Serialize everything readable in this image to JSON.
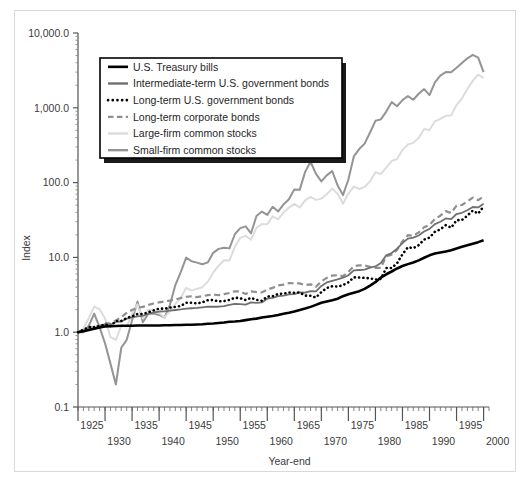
{
  "chart_data": {
    "type": "line",
    "title": "",
    "xlabel": "Year-end",
    "ylabel": "Index",
    "yscale": "log",
    "ylim": [
      0.1,
      10000
    ],
    "xlim": [
      1925,
      2001
    ],
    "grid": false,
    "legend_position": "upper-left-inside",
    "ytick_labels": [
      "10,000.0",
      "1,000.0",
      "100.0",
      "10.0",
      "1.0",
      "0.1"
    ],
    "ytick_values": [
      10000,
      1000,
      100,
      10,
      1,
      0.1
    ],
    "xtick_labels_upper": [
      "1925",
      "1935",
      "1945",
      "1955",
      "1965",
      "1975",
      "1985",
      "1995"
    ],
    "xtick_values_upper": [
      1925,
      1935,
      1945,
      1955,
      1965,
      1975,
      1985,
      1995
    ],
    "xtick_labels_lower": [
      "1930",
      "1940",
      "1950",
      "1960",
      "1970",
      "1980",
      "1990",
      "2000"
    ],
    "xtick_values_lower": [
      1930,
      1940,
      1950,
      1960,
      1970,
      1980,
      1990,
      2000
    ],
    "x": [
      1925,
      1926,
      1927,
      1928,
      1929,
      1930,
      1931,
      1932,
      1933,
      1934,
      1935,
      1936,
      1937,
      1938,
      1939,
      1940,
      1941,
      1942,
      1943,
      1944,
      1945,
      1946,
      1947,
      1948,
      1949,
      1950,
      1951,
      1952,
      1953,
      1954,
      1955,
      1956,
      1957,
      1958,
      1959,
      1960,
      1961,
      1962,
      1963,
      1964,
      1965,
      1966,
      1967,
      1968,
      1969,
      1970,
      1971,
      1972,
      1973,
      1974,
      1975,
      1976,
      1977,
      1978,
      1979,
      1980,
      1981,
      1982,
      1983,
      1984,
      1985,
      1986,
      1987,
      1988,
      1989,
      1990,
      1991,
      1992,
      1993,
      1994,
      1995,
      1996,
      1997,
      1998,
      1999,
      2000
    ],
    "series": [
      {
        "name": "U.S. Treasury bills",
        "color": "#000000",
        "style": "solid",
        "width": 2.6,
        "values": [
          1.0,
          1.03,
          1.07,
          1.11,
          1.16,
          1.19,
          1.2,
          1.21,
          1.22,
          1.22,
          1.22,
          1.23,
          1.23,
          1.23,
          1.23,
          1.23,
          1.24,
          1.24,
          1.25,
          1.25,
          1.26,
          1.26,
          1.27,
          1.28,
          1.3,
          1.31,
          1.33,
          1.35,
          1.38,
          1.39,
          1.41,
          1.45,
          1.49,
          1.52,
          1.57,
          1.61,
          1.65,
          1.7,
          1.76,
          1.82,
          1.89,
          1.98,
          2.07,
          2.18,
          2.32,
          2.47,
          2.58,
          2.68,
          2.8,
          3.03,
          3.21,
          3.37,
          3.54,
          3.8,
          4.2,
          4.67,
          5.37,
          5.95,
          6.48,
          7.11,
          7.66,
          8.13,
          8.57,
          9.13,
          9.89,
          10.66,
          11.25,
          11.66,
          12.0,
          12.47,
          13.16,
          13.83,
          14.55,
          15.26,
          16.0,
          16.9
        ]
      },
      {
        "name": "Intermediate-term U.S. government bonds",
        "color": "#707070",
        "style": "solid",
        "width": 1.8,
        "values": [
          1.0,
          1.05,
          1.1,
          1.11,
          1.18,
          1.28,
          1.26,
          1.37,
          1.39,
          1.52,
          1.58,
          1.63,
          1.66,
          1.76,
          1.84,
          1.89,
          1.9,
          1.94,
          1.98,
          2.02,
          2.07,
          2.09,
          2.11,
          2.15,
          2.19,
          2.2,
          2.19,
          2.23,
          2.32,
          2.39,
          2.37,
          2.34,
          2.51,
          2.47,
          2.5,
          2.81,
          2.87,
          3.03,
          3.08,
          3.2,
          3.22,
          3.4,
          3.38,
          3.54,
          3.51,
          4.16,
          4.62,
          4.86,
          5.08,
          5.35,
          5.77,
          6.7,
          6.79,
          6.86,
          7.31,
          7.58,
          8.39,
          10.65,
          11.44,
          13.06,
          15.55,
          17.85,
          18.36,
          19.62,
          22.19,
          24.05,
          27.9,
          30.0,
          33.14,
          32.5,
          38.0,
          39.5,
          42.7,
          47.2,
          46.6,
          52.0
        ]
      },
      {
        "name": "Long-term U.S. government bonds",
        "color": "#000000",
        "style": "dotted",
        "width": 2.6,
        "values": [
          1.0,
          1.08,
          1.17,
          1.17,
          1.21,
          1.27,
          1.2,
          1.41,
          1.41,
          1.55,
          1.63,
          1.75,
          1.75,
          1.85,
          1.96,
          2.07,
          2.06,
          2.13,
          2.18,
          2.24,
          2.48,
          2.48,
          2.42,
          2.51,
          2.68,
          2.69,
          2.58,
          2.61,
          2.7,
          2.89,
          2.85,
          2.69,
          2.88,
          2.71,
          2.63,
          3.0,
          3.03,
          3.24,
          3.28,
          3.39,
          3.37,
          3.4,
          3.09,
          3.07,
          2.91,
          3.44,
          3.9,
          4.12,
          4.07,
          4.25,
          4.64,
          5.42,
          5.38,
          5.32,
          5.26,
          5.06,
          5.16,
          7.2,
          7.22,
          8.37,
          11.0,
          13.68,
          13.3,
          14.6,
          17.3,
          18.4,
          22.0,
          23.7,
          27.0,
          24.9,
          31.4,
          31.6,
          36.2,
          42.2,
          38.5,
          48.0
        ]
      },
      {
        "name": "Long-term corporate bonds",
        "color": "#8f8f8f",
        "style": "dashed",
        "width": 2.2,
        "values": [
          1.0,
          1.07,
          1.15,
          1.18,
          1.22,
          1.32,
          1.3,
          1.44,
          1.59,
          1.81,
          1.98,
          2.12,
          2.18,
          2.32,
          2.42,
          2.51,
          2.58,
          2.65,
          2.73,
          2.86,
          2.98,
          3.02,
          2.95,
          3.03,
          3.13,
          3.2,
          3.12,
          3.23,
          3.34,
          3.52,
          3.5,
          3.25,
          3.52,
          3.44,
          3.41,
          3.72,
          3.91,
          4.22,
          4.33,
          4.53,
          4.51,
          4.49,
          4.26,
          4.37,
          4.04,
          4.79,
          5.32,
          5.72,
          5.78,
          5.62,
          6.41,
          7.61,
          7.82,
          7.79,
          7.47,
          7.25,
          7.25,
          10.35,
          10.9,
          12.6,
          16.4,
          19.8,
          19.5,
          21.6,
          25.3,
          27.2,
          32.6,
          36.1,
          41.6,
          39.2,
          49.1,
          50.2,
          56.0,
          63.0,
          58.3,
          65.5
        ]
      },
      {
        "name": "Large-firm common stocks",
        "color": "#dcdcdc",
        "style": "solid",
        "width": 2.0,
        "values": [
          1.0,
          1.12,
          1.54,
          2.2,
          2.02,
          1.52,
          0.86,
          0.79,
          1.21,
          1.19,
          1.76,
          2.36,
          1.53,
          2.0,
          1.99,
          1.79,
          1.58,
          1.9,
          2.4,
          2.87,
          3.92,
          3.6,
          3.8,
          4.0,
          4.74,
          6.25,
          7.74,
          9.17,
          9.07,
          13.85,
          18.23,
          19.4,
          17.3,
          24.8,
          27.8,
          27.9,
          35.4,
          32.3,
          39.7,
          46.2,
          51.9,
          46.7,
          57.9,
          64.3,
          58.8,
          61.1,
          69.9,
          83.1,
          70.9,
          52.1,
          71.4,
          88.4,
          82.1,
          87.5,
          103.7,
          137.3,
          130.5,
          158.6,
          194.4,
          206.5,
          272.0,
          322.8,
          339.9,
          396.3,
          521.9,
          505.6,
          659.4,
          709.5,
          780.8,
          791.1,
          1088.0,
          1338.0,
          1783.0,
          2290.0,
          2772.0,
          2520.0
        ]
      },
      {
        "name": "Small-firm common stocks",
        "color": "#949494",
        "style": "solid",
        "width": 2.0,
        "values": [
          1.0,
          1.0,
          1.22,
          1.77,
          1.16,
          0.71,
          0.38,
          0.2,
          0.62,
          0.79,
          1.43,
          2.58,
          1.36,
          1.77,
          1.77,
          1.7,
          1.57,
          2.32,
          4.27,
          6.36,
          9.93,
          8.89,
          8.51,
          8.09,
          8.57,
          11.5,
          13.0,
          13.5,
          13.2,
          20.4,
          24.6,
          26.0,
          21.0,
          35.8,
          41.0,
          37.0,
          47.5,
          41.0,
          51.0,
          60.0,
          81.0,
          80.0,
          139.0,
          190.0,
          131.0,
          104.0,
          125.0,
          143.0,
          92.0,
          68.0,
          110.0,
          224.0,
          281.0,
          332.0,
          468.0,
          670.0,
          700.0,
          890.0,
          1190.0,
          1050.0,
          1270.0,
          1430.0,
          1280.0,
          1540.0,
          1780.0,
          1480.0,
          2190.0,
          2700.0,
          3000.0,
          2980.0,
          3420.0,
          3980.0,
          4590.0,
          5090.0,
          4700.0,
          3000.0
        ]
      }
    ]
  },
  "legend": {
    "items": [
      {
        "label": "U.S. Treasury bills"
      },
      {
        "label": "Intermediate-term U.S. government bonds"
      },
      {
        "label": "Long-term U.S. government bonds"
      },
      {
        "label": "Long-term corporate bonds"
      },
      {
        "label": "Large-firm common stocks"
      },
      {
        "label": "Small-firm common stocks"
      }
    ]
  },
  "axes": {
    "y_title": "Index",
    "x_title": "Year-end"
  }
}
